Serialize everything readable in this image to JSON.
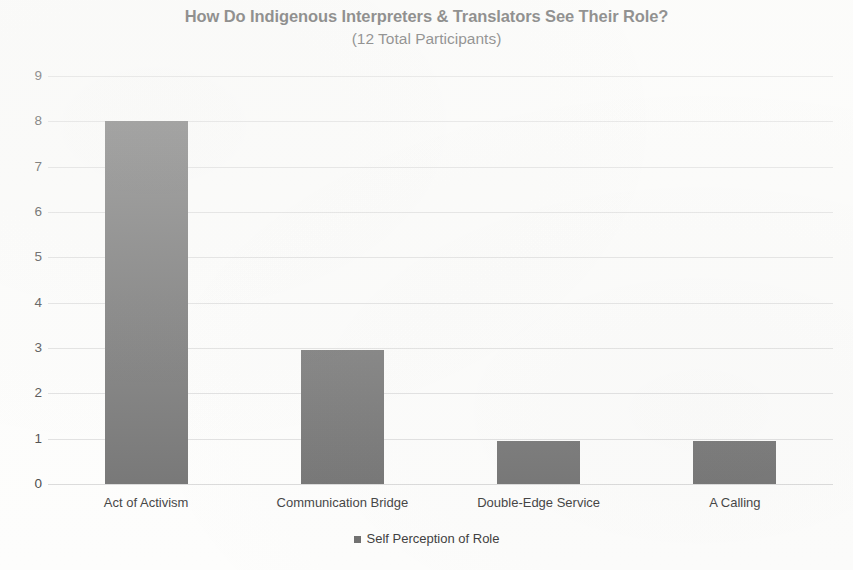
{
  "chart_data": {
    "type": "bar",
    "title": "How Do Indigenous Interpreters & Translators See Their Role?",
    "subtitle": "(12 Total Participants)",
    "xlabel": "",
    "ylabel": "",
    "categories": [
      "Act of Activism",
      "Communication Bridge",
      "Double-Edge Service",
      "A Calling"
    ],
    "series": [
      {
        "name": "Self Perception of Role",
        "values": [
          8,
          2.95,
          0.95,
          0.95
        ],
        "color": "#6e6e6e"
      }
    ],
    "ylim": [
      0,
      9
    ],
    "ytick_labels": [
      "9",
      "8",
      "7",
      "6",
      "5",
      "4",
      "3",
      "2",
      "1",
      "0"
    ],
    "ytick_values": [
      9,
      8,
      7,
      6,
      5,
      4,
      3,
      2,
      1,
      0
    ],
    "grid": true,
    "grid_color": "#d9d9d9",
    "legend": {
      "position": "bottom",
      "entries": [
        {
          "label": "Self Perception of Role",
          "marker": "square-marker",
          "color": "#6e6e6e"
        }
      ]
    },
    "background_color": "#fdfdfc",
    "text_color": "#3a3a3a"
  }
}
